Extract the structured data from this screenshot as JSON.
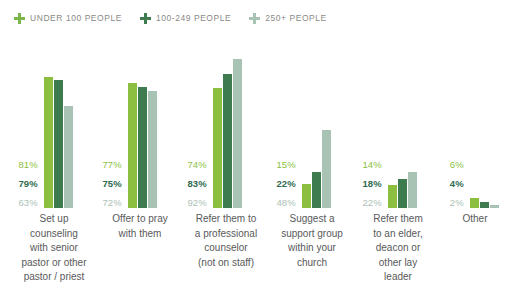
{
  "legend": {
    "items": [
      {
        "label": "UNDER 100 PEOPLE",
        "icon": "plus-icon",
        "color": "#7ab648"
      },
      {
        "label": "100-249 PEOPLE",
        "icon": "plus-icon",
        "color": "#3e7b4f"
      },
      {
        "label": "250+ PEOPLE",
        "icon": "plus-icon",
        "color": "#a8c2b4"
      }
    ]
  },
  "chart_data": {
    "type": "bar",
    "title": "",
    "subtitle": "",
    "xlabel": "",
    "ylabel": "",
    "ylim": [
      0,
      100
    ],
    "grid": false,
    "legend_position": "top-left",
    "value_suffix": "%",
    "categories": [
      "Set up counseling with senior pastor or other pastor / priest",
      "Offer to pray with them",
      "Refer them to a professional counselor (not on staff)",
      "Suggest a support group within your church",
      "Refer them to an elder, deacon or other lay leader",
      "Other"
    ],
    "series": [
      {
        "name": "UNDER 100 PEOPLE",
        "color": "#8cbf3f",
        "values": [
          81,
          77,
          74,
          15,
          14,
          6
        ]
      },
      {
        "name": "100-249 PEOPLE",
        "color": "#3e7b4f",
        "values": [
          79,
          75,
          83,
          22,
          18,
          4
        ]
      },
      {
        "name": "250+ PEOPLE",
        "color": "#a8c2b4",
        "values": [
          63,
          72,
          92,
          48,
          22,
          2
        ]
      }
    ],
    "labels": [
      [
        "81%",
        "79%",
        "63%"
      ],
      [
        "77%",
        "75%",
        "72%"
      ],
      [
        "74%",
        "83%",
        "92%"
      ],
      [
        "15%",
        "22%",
        "48%"
      ],
      [
        "14%",
        "18%",
        "22%"
      ],
      [
        "6%",
        "4%",
        "2%"
      ]
    ]
  },
  "category_lines": [
    [
      "Set up",
      "counseling",
      "with senior",
      "pastor or other",
      "pastor / priest"
    ],
    [
      "Offer to pray",
      "with them"
    ],
    [
      "Refer them to",
      "a professional",
      "counselor",
      "(not on staff)"
    ],
    [
      "Suggest a",
      "support group",
      "within your",
      "church"
    ],
    [
      "Refer them",
      "to an elder,",
      "deacon or",
      "other lay",
      "leader"
    ],
    [
      "Other"
    ]
  ]
}
